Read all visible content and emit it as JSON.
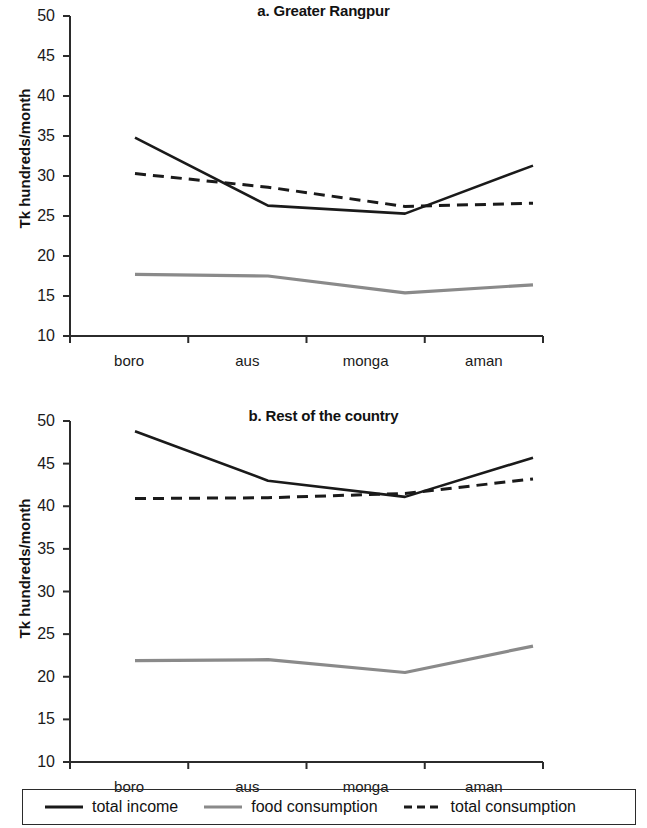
{
  "figure": {
    "ylabel": "Tk hundreds/month",
    "categories": [
      "boro",
      "aus",
      "monga",
      "aman"
    ],
    "yticks": [
      "50",
      "45",
      "40",
      "35",
      "30",
      "25",
      "20",
      "15",
      "10"
    ]
  },
  "legend": {
    "items": [
      {
        "label": "total income",
        "style": "solid",
        "color": "#1a1a1a"
      },
      {
        "label": "food consumption",
        "style": "solid",
        "color": "#8a8a8a"
      },
      {
        "label": "total consumption",
        "style": "dashed",
        "color": "#1a1a1a"
      }
    ]
  },
  "panel_a": {
    "title": "a. Greater Rangpur"
  },
  "panel_b": {
    "title": "b. Rest of the country"
  },
  "chart_data": [
    {
      "type": "line",
      "title": "a. Greater Rangpur",
      "xlabel": "",
      "ylabel": "Tk hundreds/month",
      "categories": [
        "boro",
        "aus",
        "monga",
        "aman"
      ],
      "ylim": [
        10,
        50
      ],
      "yticks": [
        10,
        15,
        20,
        25,
        30,
        35,
        40,
        45,
        50
      ],
      "grid": false,
      "legend_position": "bottom",
      "series": [
        {
          "name": "total income",
          "style": "solid",
          "color": "#1a1a1a",
          "values": [
            34.8,
            26.3,
            25.3,
            31.3
          ]
        },
        {
          "name": "food consumption",
          "style": "solid",
          "color": "#8a8a8a",
          "values": [
            17.7,
            17.5,
            15.4,
            16.4
          ]
        },
        {
          "name": "total consumption",
          "style": "dashed",
          "color": "#1a1a1a",
          "values": [
            30.3,
            28.6,
            26.2,
            26.6
          ]
        }
      ]
    },
    {
      "type": "line",
      "title": "b. Rest of the country",
      "xlabel": "",
      "ylabel": "Tk hundreds/month",
      "categories": [
        "boro",
        "aus",
        "monga",
        "aman"
      ],
      "ylim": [
        10,
        50
      ],
      "yticks": [
        10,
        15,
        20,
        25,
        30,
        35,
        40,
        45,
        50
      ],
      "grid": false,
      "legend_position": "bottom",
      "series": [
        {
          "name": "total income",
          "style": "solid",
          "color": "#1a1a1a",
          "values": [
            48.8,
            43.0,
            41.1,
            45.7
          ]
        },
        {
          "name": "food consumption",
          "style": "solid",
          "color": "#8a8a8a",
          "values": [
            21.9,
            22.0,
            20.5,
            23.6
          ]
        },
        {
          "name": "total consumption",
          "style": "dashed",
          "color": "#1a1a1a",
          "values": [
            40.9,
            41.0,
            41.5,
            43.2
          ]
        }
      ]
    }
  ]
}
